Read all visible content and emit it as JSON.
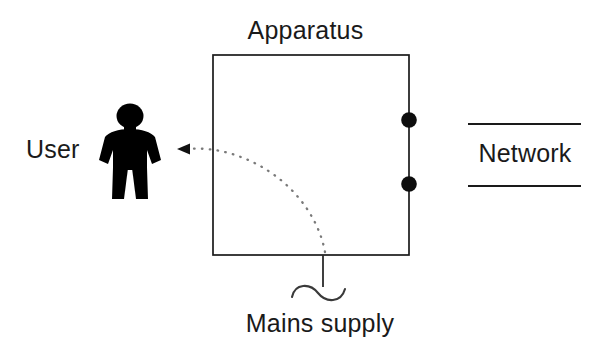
{
  "diagram": {
    "title": "Apparatus",
    "background_color": "#ffffff",
    "stroke_color": "#1a1a1a",
    "fill_color": "#000000",
    "labels": {
      "apparatus": "Apparatus",
      "user": "User",
      "network": "Network",
      "mains_supply": "Mains supply"
    },
    "nodes": [
      {
        "id": "apparatus-box",
        "name": "apparatus-box",
        "shape": "rectangle",
        "x": 213,
        "y": 55,
        "width": 196,
        "height": 200,
        "stroke": "#1a1a1a",
        "stroke_width": 1.6,
        "fill": "#ffffff",
        "label": "Apparatus"
      },
      {
        "id": "user-figure",
        "name": "user-figure",
        "shape": "person-pictogram",
        "x": 100,
        "y": 104,
        "width": 60,
        "height": 95,
        "fill": "#000000",
        "label": "User"
      },
      {
        "id": "network-band",
        "name": "network-band",
        "shape": "two-parallel-lines",
        "x": 468,
        "y": 124,
        "width": 113,
        "height": 62,
        "stroke": "#1a1a1a",
        "label": "Network"
      }
    ],
    "terminals": [
      {
        "id": "terminal-upper",
        "name": "network-terminal-upper",
        "cx": 409,
        "cy": 120,
        "r": 7.5,
        "fill": "#000000"
      },
      {
        "id": "terminal-lower",
        "name": "network-terminal-lower",
        "cx": 409,
        "cy": 184,
        "r": 7.5,
        "fill": "#000000"
      }
    ],
    "connections": [
      {
        "id": "mains-lead",
        "name": "mains-supply-lead",
        "type": "solid-line",
        "from_x": 323,
        "from_y": 255,
        "to_x": 323,
        "to_y": 286,
        "stroke": "#1a1a1a"
      },
      {
        "id": "mains-waveform",
        "name": "mains-ac-waveform",
        "type": "sine-squiggle",
        "x": 292,
        "y": 292,
        "width": 54,
        "amplitude": 9,
        "stroke": "#1a1a1a"
      },
      {
        "id": "hazard-path",
        "name": "hazard-current-path-arrow",
        "type": "dotted-curve-arrow",
        "from_x": 325,
        "from_y": 252,
        "to_x": 186,
        "to_y": 149,
        "arrowhead": "left",
        "stroke": "#6d6d6d"
      }
    ]
  }
}
